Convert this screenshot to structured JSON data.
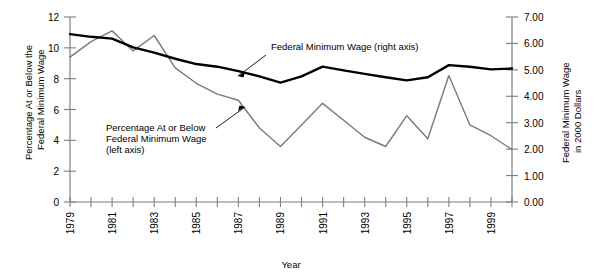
{
  "chart_data": {
    "type": "line",
    "title": "",
    "xlabel": "Year",
    "ylabel": "Percentage At or Below the Federal Minimum Wage",
    "y2label": "Federal Minimum Wage in 2000 Dollars",
    "xlim": [
      1979,
      2000
    ],
    "ylim": [
      0,
      12
    ],
    "y2lim": [
      0.0,
      7.0
    ],
    "grid": false,
    "legend_position": "inline-annotations",
    "x": [
      1979,
      1980,
      1981,
      1982,
      1983,
      1984,
      1985,
      1986,
      1987,
      1988,
      1989,
      1990,
      1991,
      1992,
      1993,
      1994,
      1995,
      1996,
      1997,
      1998,
      1999,
      2000
    ],
    "xticks_major": [
      "1979",
      "1981",
      "1983",
      "1985",
      "1987",
      "1989",
      "1991",
      "1993",
      "1995",
      "1997",
      "1999"
    ],
    "yticks_left": [
      "0",
      "2",
      "4",
      "6",
      "8",
      "10",
      "12"
    ],
    "yticks_right": [
      "0.00",
      "1.00",
      "2.00",
      "3.00",
      "4.00",
      "5.00",
      "6.00",
      "7.00"
    ],
    "series": [
      {
        "name": "Percentage At or Below Federal Minimum Wage",
        "axis": "left",
        "color": "#7a7a7a",
        "width": 1.4,
        "values": [
          9.4,
          10.4,
          11.1,
          9.8,
          10.8,
          8.7,
          7.7,
          7.0,
          6.6,
          4.8,
          3.6,
          5.0,
          6.4,
          5.3,
          4.2,
          3.6,
          5.6,
          4.1,
          8.2,
          5.0,
          4.3,
          3.4
        ]
      },
      {
        "name": "Federal Minimum Wage",
        "axis": "right",
        "color": "#000000",
        "width": 2.4,
        "values": [
          6.35,
          6.25,
          6.18,
          5.85,
          5.65,
          5.42,
          5.22,
          5.12,
          4.95,
          4.75,
          4.52,
          4.75,
          5.12,
          4.98,
          4.85,
          4.72,
          4.6,
          4.72,
          5.18,
          5.12,
          5.02,
          5.05
        ]
      }
    ],
    "annotations": [
      {
        "text": "Federal Minimum Wage (right axis)",
        "lines": [
          "Federal Minimum Wage (right axis)"
        ]
      },
      {
        "text": "Percentage At or Below Federal Minimum Wage (left axis)",
        "lines": [
          "Percentage At or Below",
          "Federal Minimum Wage",
          "(left axis)"
        ]
      }
    ]
  },
  "axis_titles": {
    "left_line1": "Percentage At or Below the",
    "left_line2": "Federal Minimum Wage",
    "right_line1": "Federal Minimum Wage",
    "right_line2": "in 2000 Dollars",
    "bottom": "Year"
  }
}
